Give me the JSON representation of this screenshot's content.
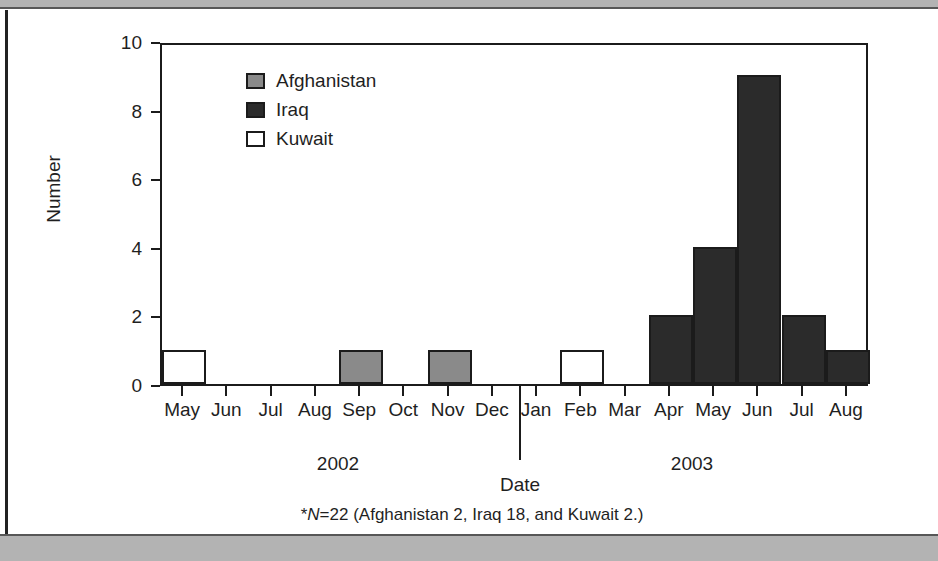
{
  "figure": {
    "footnote_prefix": "*",
    "footnote_n": "N",
    "footnote_rest": "=22 (Afghanistan 2, Iraq 18, and Kuwait 2.)"
  },
  "legend": {
    "items": [
      {
        "label": "Afghanistan",
        "color": "#8a8a8a"
      },
      {
        "label": "Iraq",
        "color": "#2b2b2b"
      },
      {
        "label": "Kuwait",
        "color": "#ffffff"
      }
    ]
  },
  "chart_data": {
    "type": "bar",
    "title": "",
    "xlabel": "Date",
    "ylabel": "Number",
    "ylim": [
      0,
      10
    ],
    "yticks": [
      0,
      2,
      4,
      6,
      8,
      10
    ],
    "grid": false,
    "legend_position": "top-left-inside",
    "categories": [
      "May",
      "Jun",
      "Jul",
      "Aug",
      "Sep",
      "Oct",
      "Nov",
      "Dec",
      "Jan",
      "Feb",
      "Mar",
      "Apr",
      "May",
      "Jun",
      "Jul",
      "Aug"
    ],
    "values": [
      1,
      0,
      0,
      0,
      1,
      0,
      1,
      0,
      0,
      1,
      0,
      2,
      4,
      9,
      2,
      1
    ],
    "point_colors": [
      "Kuwait",
      null,
      null,
      null,
      "Afghanistan",
      null,
      "Afghanistan",
      null,
      null,
      "Kuwait",
      null,
      "Iraq",
      "Iraq",
      "Iraq",
      "Iraq",
      "Iraq"
    ],
    "group_labels": [
      {
        "label": "2002",
        "categories": [
          "May",
          "Jun",
          "Jul",
          "Aug",
          "Sep",
          "Oct",
          "Nov",
          "Dec"
        ]
      },
      {
        "label": "2003",
        "categories": [
          "Jan",
          "Feb",
          "Mar",
          "Apr",
          "May",
          "Jun",
          "Jul",
          "Aug"
        ]
      }
    ],
    "series": [
      {
        "name": "Afghanistan",
        "color": "#8a8a8a",
        "total": 2
      },
      {
        "name": "Iraq",
        "color": "#2b2b2b",
        "total": 18
      },
      {
        "name": "Kuwait",
        "color": "#ffffff",
        "total": 2
      }
    ],
    "total": 22
  }
}
